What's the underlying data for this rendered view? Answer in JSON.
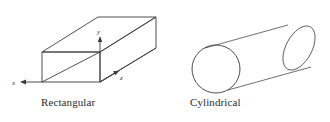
{
  "figure": {
    "background_color": "#ffffff",
    "stroke_color": "#3b3b3b",
    "label_color": "#2b2b2b"
  },
  "shapes": [
    {
      "id": "rectangular",
      "caption": "Rectangular",
      "type": "wireframe-rectangular-prism",
      "axes": [
        {
          "name": "x",
          "label": "x",
          "direction": "left"
        },
        {
          "name": "y",
          "label": "y",
          "direction": "up"
        },
        {
          "name": "z",
          "label": "z",
          "direction": "up-right"
        }
      ]
    },
    {
      "id": "cylindrical",
      "caption": "Cylindrical",
      "type": "tilted-cylinder",
      "axes": []
    }
  ]
}
